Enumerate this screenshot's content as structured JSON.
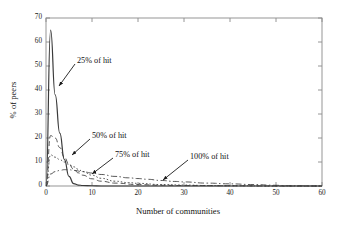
{
  "chart_data": {
    "type": "line",
    "title": "",
    "xlabel": "Number of communities",
    "ylabel": "% of peers",
    "xlim": [
      0,
      60
    ],
    "ylim": [
      0,
      70
    ],
    "xticks": [
      0,
      10,
      20,
      30,
      40,
      50,
      60
    ],
    "yticks": [
      0,
      10,
      20,
      30,
      40,
      50,
      60,
      70
    ],
    "grid": false,
    "legend": "none (inline arrow annotations)",
    "annotations": [
      {
        "text": "25% of hit",
        "label_x": 77,
        "label_y": 61,
        "arrow_to_x": 59,
        "arrow_to_y": 86
      },
      {
        "text": "50% of hit",
        "label_x": 92,
        "label_y": 136,
        "arrow_to_x": 72,
        "arrow_to_y": 155
      },
      {
        "text": "75% of hit",
        "label_x": 115,
        "label_y": 155,
        "arrow_to_x": 92,
        "arrow_to_y": 174
      },
      {
        "text": "100% of hit",
        "label_x": 190,
        "label_y": 157,
        "arrow_to_x": 163,
        "arrow_to_y": 180
      }
    ],
    "series": [
      {
        "name": "25% of hit",
        "style": "solid",
        "x": [
          0,
          1,
          2,
          3,
          4,
          5,
          6,
          7,
          8,
          10,
          12,
          15,
          20,
          30,
          40,
          50,
          60
        ],
        "values": [
          0,
          65,
          38,
          22,
          11,
          4,
          1,
          0.4,
          0.2,
          0.1,
          0,
          0,
          0,
          0,
          0,
          0,
          0
        ]
      },
      {
        "name": "50% of hit",
        "style": "dashed",
        "x": [
          0,
          1,
          2,
          3,
          4,
          5,
          6,
          7,
          8,
          10,
          12,
          15,
          20,
          25,
          30,
          40,
          50,
          60
        ],
        "values": [
          0,
          21,
          20,
          16,
          12,
          9,
          7,
          5.5,
          4.5,
          3,
          2,
          1.2,
          0.6,
          0.3,
          0.2,
          0.1,
          0,
          0
        ]
      },
      {
        "name": "75% of hit",
        "style": "dotted",
        "x": [
          0,
          1,
          2,
          3,
          4,
          5,
          6,
          7,
          8,
          10,
          12,
          15,
          18,
          20,
          25,
          30,
          35,
          40,
          50,
          60
        ],
        "values": [
          0,
          13,
          12,
          11,
          10,
          9,
          8,
          7,
          6,
          4.5,
          3.2,
          2,
          1.4,
          1.1,
          0.6,
          0.4,
          0.2,
          0.1,
          0,
          0
        ]
      },
      {
        "name": "100% of hit",
        "style": "dash-dot",
        "x": [
          0,
          1,
          2,
          3,
          4,
          5,
          6,
          8,
          10,
          12,
          15,
          18,
          20,
          22,
          25,
          28,
          30,
          35,
          40,
          45,
          50,
          52,
          60
        ],
        "values": [
          0,
          5,
          6,
          6.5,
          6.8,
          6.8,
          6.5,
          6,
          5.4,
          4.8,
          4,
          3.4,
          3.1,
          2.8,
          2.3,
          1.9,
          1.7,
          1.2,
          0.9,
          0.6,
          0.3,
          0.1,
          0
        ]
      }
    ],
    "colors": {
      "axis": "#7a7a7a",
      "line": "#3a3a3a",
      "text": "#111111",
      "background": "#ffffff"
    }
  }
}
